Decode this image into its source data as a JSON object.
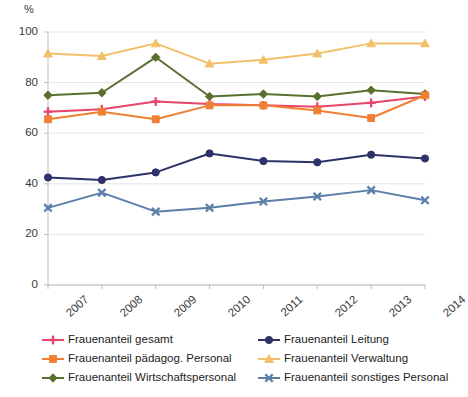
{
  "axis": {
    "unit_label": "%",
    "y_ticks": [
      "0",
      "20",
      "40",
      "60",
      "80",
      "100"
    ],
    "x_ticks": [
      "2007",
      "2008",
      "2009",
      "2010",
      "2011",
      "2012",
      "2013",
      "2014"
    ]
  },
  "legend": {
    "left": [
      {
        "label": "Frauenanteil gesamt",
        "color": "#e8456b",
        "marker": "plus-marker",
        "icon": "line-with-plus-marker-icon"
      },
      {
        "label": "Frauenanteil pädagog. Personal",
        "color": "#ef8033",
        "marker": "square-marker",
        "icon": "line-with-square-marker-icon"
      },
      {
        "label": "Frauenanteil Wirtschaftspersonal",
        "color": "#5a7030",
        "marker": "diamond-marker",
        "icon": "line-with-diamond-marker-icon"
      }
    ],
    "right": [
      {
        "label": "Frauenanteil Leitung",
        "color": "#2d3268",
        "marker": "circle-marker",
        "icon": "line-with-circle-marker-icon"
      },
      {
        "label": "Frauenanteil Verwaltung",
        "color": "#f3c06a",
        "marker": "triangle-marker",
        "icon": "line-with-triangle-marker-icon"
      },
      {
        "label": "Frauenanteil sonstiges Personal",
        "color": "#5b7fa6",
        "marker": "x-marker",
        "icon": "line-with-x-marker-icon"
      }
    ]
  },
  "chart_data": {
    "type": "line",
    "title": "",
    "xlabel": "",
    "ylabel": "%",
    "ylim": [
      0,
      100
    ],
    "ytick_step": 20,
    "grid": true,
    "legend_position": "bottom",
    "categories": [
      "2007",
      "2008",
      "2009",
      "2010",
      "2011",
      "2012",
      "2013",
      "2014"
    ],
    "series": [
      {
        "name": "Frauenanteil gesamt",
        "color": "#e8456b",
        "marker": "plus",
        "values": [
          68.5,
          69.5,
          72.5,
          71.5,
          71.0,
          70.5,
          72.0,
          74.5
        ]
      },
      {
        "name": "Frauenanteil pädagog. Personal",
        "color": "#ef8033",
        "marker": "square",
        "values": [
          65.5,
          68.5,
          65.5,
          71.0,
          71.0,
          69.0,
          66.0,
          75.0
        ]
      },
      {
        "name": "Frauenanteil Wirtschaftspersonal",
        "color": "#5a7030",
        "marker": "diamond",
        "values": [
          75.0,
          76.0,
          90.0,
          74.5,
          75.5,
          74.5,
          77.0,
          75.5
        ]
      },
      {
        "name": "Frauenanteil Leitung",
        "color": "#2d3268",
        "marker": "circle",
        "values": [
          42.5,
          41.5,
          44.5,
          52.0,
          49.0,
          48.5,
          51.5,
          50.0
        ]
      },
      {
        "name": "Frauenanteil Verwaltung",
        "color": "#f3c06a",
        "marker": "triangle",
        "values": [
          91.5,
          90.5,
          95.5,
          87.5,
          89.0,
          91.5,
          95.5,
          95.5
        ]
      },
      {
        "name": "Frauenanteil sonstiges Personal",
        "color": "#5b7fa6",
        "marker": "x",
        "values": [
          30.5,
          36.5,
          29.0,
          30.5,
          33.0,
          35.0,
          37.5,
          33.5
        ]
      }
    ]
  }
}
